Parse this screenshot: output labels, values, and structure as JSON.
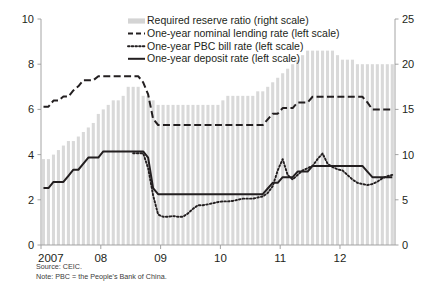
{
  "figure": {
    "source_note": "Source: CEIC.",
    "definition_note": "Note: PBC = the People's Bank of China."
  },
  "legend": {
    "items": [
      {
        "label": "Required reserve ratio (right scale)",
        "marker": "bar-swatch-icon",
        "color": "#d4d4d4"
      },
      {
        "label": "One-year nominal lending rate (left scale)",
        "marker": "dashed-line-icon",
        "color": "#231f20"
      },
      {
        "label": "One-year PBC bill rate (left scale)",
        "marker": "dotted-line-icon",
        "color": "#231f20"
      },
      {
        "label": "One-year deposit rate (left scale)",
        "marker": "solid-line-icon",
        "color": "#231f20"
      }
    ]
  },
  "axes": {
    "left_ticks": [
      "0",
      "2",
      "4",
      "6",
      "8",
      "10"
    ],
    "right_ticks": [
      "0",
      "5",
      "10",
      "15",
      "20",
      "25"
    ],
    "x_ticks": [
      "2007",
      "08",
      "09",
      "10",
      "11",
      "12"
    ]
  },
  "chart_data": {
    "type": "line",
    "title": "",
    "xlabel": "",
    "ylabel": "",
    "ylim": [
      0,
      10
    ],
    "y2lim": [
      0,
      25
    ],
    "grid": false,
    "legend_position": "top-center",
    "x_tick_labels": [
      "2007",
      "08",
      "09",
      "10",
      "11",
      "12"
    ],
    "x_tick_values": [
      2007.0,
      2008.0,
      2009.0,
      2010.0,
      2011.0,
      2012.0
    ],
    "x_range": [
      2007.0,
      2012.92
    ],
    "x_monthly": [
      2007.0,
      2007.083,
      2007.167,
      2007.25,
      2007.333,
      2007.417,
      2007.5,
      2007.583,
      2007.667,
      2007.75,
      2007.833,
      2007.917,
      2008.0,
      2008.083,
      2008.167,
      2008.25,
      2008.333,
      2008.417,
      2008.5,
      2008.583,
      2008.667,
      2008.75,
      2008.833,
      2008.917,
      2009.0,
      2009.083,
      2009.167,
      2009.25,
      2009.333,
      2009.417,
      2009.5,
      2009.583,
      2009.667,
      2009.75,
      2009.833,
      2009.917,
      2010.0,
      2010.083,
      2010.167,
      2010.25,
      2010.333,
      2010.417,
      2010.5,
      2010.583,
      2010.667,
      2010.75,
      2010.833,
      2010.917,
      2011.0,
      2011.083,
      2011.167,
      2011.25,
      2011.333,
      2011.417,
      2011.5,
      2011.583,
      2011.667,
      2011.75,
      2011.833,
      2011.917,
      2012.0,
      2012.083,
      2012.167,
      2012.25,
      2012.333,
      2012.417,
      2012.5,
      2012.583,
      2012.667,
      2012.75,
      2012.833
    ],
    "series": [
      {
        "name": "Required reserve ratio (right scale)",
        "type": "bar",
        "axis": "right",
        "unit": "percent",
        "color": "#d9d9d9",
        "values": [
          9.5,
          9.5,
          10.0,
          10.5,
          11.0,
          11.5,
          11.5,
          12.0,
          12.5,
          13.0,
          13.5,
          14.5,
          15.0,
          15.5,
          16.0,
          16.0,
          16.5,
          17.5,
          17.5,
          17.5,
          16.5,
          16.5,
          16.0,
          15.5,
          15.5,
          15.5,
          15.5,
          15.5,
          15.5,
          15.5,
          15.5,
          15.5,
          15.5,
          15.5,
          15.5,
          15.5,
          16.0,
          16.5,
          16.5,
          16.5,
          16.5,
          16.5,
          16.5,
          17.0,
          17.0,
          17.5,
          18.0,
          18.5,
          19.0,
          19.5,
          20.0,
          20.5,
          21.0,
          21.5,
          21.5,
          21.5,
          21.5,
          21.5,
          21.5,
          21.0,
          20.5,
          20.5,
          20.5,
          20.0,
          20.0,
          20.0,
          20.0,
          20.0,
          20.0,
          20.0,
          20.0
        ]
      },
      {
        "name": "One-year nominal lending rate (left scale)",
        "type": "line",
        "style": "dashed",
        "axis": "left",
        "unit": "percent",
        "color": "#231f20",
        "values": [
          6.12,
          6.12,
          6.39,
          6.39,
          6.57,
          6.57,
          6.84,
          7.02,
          7.29,
          7.29,
          7.29,
          7.47,
          7.47,
          7.47,
          7.47,
          7.47,
          7.47,
          7.47,
          7.47,
          7.47,
          7.2,
          6.66,
          5.58,
          5.31,
          5.31,
          5.31,
          5.31,
          5.31,
          5.31,
          5.31,
          5.31,
          5.31,
          5.31,
          5.31,
          5.31,
          5.31,
          5.31,
          5.31,
          5.31,
          5.31,
          5.31,
          5.31,
          5.31,
          5.31,
          5.31,
          5.56,
          5.81,
          5.81,
          6.06,
          6.06,
          6.06,
          6.31,
          6.31,
          6.31,
          6.56,
          6.56,
          6.56,
          6.56,
          6.56,
          6.56,
          6.56,
          6.56,
          6.56,
          6.56,
          6.56,
          6.31,
          6.0,
          6.0,
          6.0,
          6.0,
          6.0
        ]
      },
      {
        "name": "One-year PBC bill rate (left scale)",
        "type": "line",
        "style": "dotted",
        "axis": "left",
        "unit": "percent",
        "color": "#231f20",
        "values": [
          null,
          null,
          null,
          null,
          null,
          null,
          null,
          null,
          null,
          null,
          null,
          null,
          null,
          null,
          null,
          null,
          null,
          null,
          4.06,
          4.06,
          4.06,
          3.4,
          2.2,
          1.35,
          1.25,
          1.25,
          1.28,
          1.25,
          1.25,
          1.4,
          1.6,
          1.76,
          1.76,
          1.8,
          1.85,
          1.9,
          1.93,
          1.93,
          1.95,
          2.0,
          2.05,
          2.05,
          2.05,
          2.1,
          2.15,
          2.3,
          2.6,
          3.3,
          3.8,
          3.1,
          2.9,
          3.1,
          3.3,
          3.4,
          3.5,
          3.8,
          4.05,
          3.6,
          3.45,
          3.35,
          3.3,
          3.1,
          2.9,
          2.75,
          2.7,
          2.65,
          2.7,
          2.8,
          2.95,
          3.05,
          3.1
        ]
      },
      {
        "name": "One-year deposit rate (left scale)",
        "type": "line",
        "style": "solid",
        "axis": "left",
        "unit": "percent",
        "color": "#231f20",
        "values": [
          2.52,
          2.52,
          2.79,
          2.79,
          2.79,
          3.06,
          3.33,
          3.33,
          3.6,
          3.87,
          3.87,
          3.87,
          4.14,
          4.14,
          4.14,
          4.14,
          4.14,
          4.14,
          4.14,
          4.14,
          4.14,
          3.87,
          2.52,
          2.25,
          2.25,
          2.25,
          2.25,
          2.25,
          2.25,
          2.25,
          2.25,
          2.25,
          2.25,
          2.25,
          2.25,
          2.25,
          2.25,
          2.25,
          2.25,
          2.25,
          2.25,
          2.25,
          2.25,
          2.25,
          2.25,
          2.5,
          2.75,
          2.75,
          3.0,
          3.0,
          3.0,
          3.25,
          3.25,
          3.25,
          3.5,
          3.5,
          3.5,
          3.5,
          3.5,
          3.5,
          3.5,
          3.5,
          3.5,
          3.5,
          3.5,
          3.25,
          3.0,
          3.0,
          3.0,
          3.0,
          3.0
        ]
      }
    ]
  }
}
